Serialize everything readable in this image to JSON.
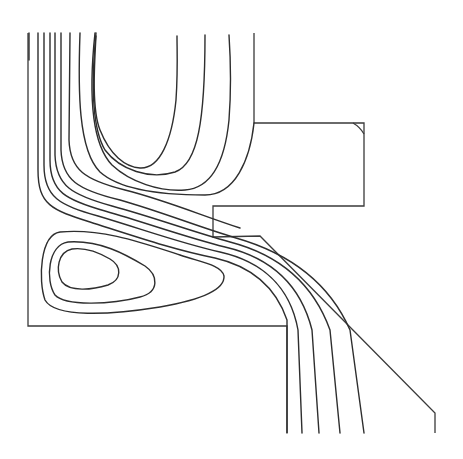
{
  "diagram": {
    "type": "streamline-contour-plot",
    "line_color": "#2e2e2e",
    "wall_color": "#3a3a3a",
    "background": "#ffffff",
    "boundary": {
      "left_wall": {
        "x": 28,
        "y_top": 33,
        "y_bottom": 326
      },
      "bottom_step": {
        "y": 326,
        "x_left": 28,
        "x_right": 287
      },
      "outlet_left_wall": {
        "x": 287,
        "y_top": 326,
        "y_bottom": 433
      },
      "upper_block": {
        "top_y": 123,
        "bottom_y": 206,
        "left_x": 254,
        "right_x": 364
      },
      "lip": {
        "x": 213,
        "y_top": 206,
        "y_bottom": 237
      },
      "diagonal_wall": {
        "from": [
          260,
          236
        ],
        "to": [
          435,
          413
        ]
      },
      "outlet_right_wall": {
        "x": 435,
        "y_top": 413,
        "y_bottom": 433
      }
    },
    "streamline_count": 14,
    "vortices": [
      {
        "name": "upper-recirculation",
        "center_approx": [
          135,
          90
        ]
      },
      {
        "name": "lower-left-recirculation",
        "center_approx": [
          88,
          268
        ]
      }
    ]
  }
}
